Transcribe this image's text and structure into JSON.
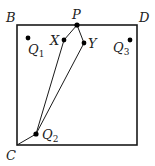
{
  "diagram": {
    "type": "geometry-square",
    "square": {
      "corners": [
        "B",
        "D",
        "C"
      ],
      "x": 17,
      "y": 25,
      "size": 120
    },
    "labels": {
      "B": "B",
      "D": "D",
      "C": "C",
      "P": "P",
      "X": "X",
      "Y": "Y",
      "Q1": {
        "main": "Q",
        "sub": "1"
      },
      "Q2": {
        "main": "Q",
        "sub": "2"
      },
      "Q3": {
        "main": "Q",
        "sub": "3"
      }
    },
    "points": {
      "P": [
        77,
        25
      ],
      "X": [
        64,
        40
      ],
      "Y": [
        84,
        43
      ],
      "Q1": [
        28,
        38
      ],
      "Q2": [
        36,
        134
      ],
      "Q3": [
        130,
        40
      ],
      "C": [
        17,
        145
      ]
    },
    "segments": [
      [
        "P",
        "X"
      ],
      [
        "X",
        "Q2"
      ],
      [
        "P",
        "Y"
      ],
      [
        "Y",
        "Q2"
      ],
      [
        "C",
        "Q2"
      ]
    ],
    "colors": {
      "stroke": "#1a1a1a",
      "point": "#000000"
    }
  }
}
